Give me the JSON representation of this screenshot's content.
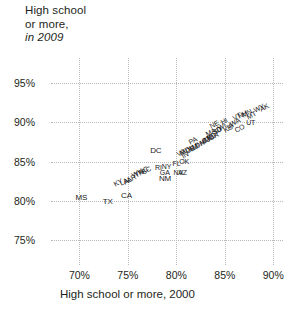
{
  "chart_data": {
    "type": "scatter",
    "ylabel_line1": "High school",
    "ylabel_line2": "or more,",
    "ylabel_line3": "in 2009",
    "xlabel": "High school or more, 2000",
    "xlim": [
      68.0,
      91.0
    ],
    "ylim": [
      73.0,
      97.0
    ],
    "xticks": [
      "70%",
      "75%",
      "80%",
      "85%",
      "90%"
    ],
    "xtick_values": [
      70,
      75,
      80,
      85,
      90
    ],
    "yticks": [
      "75%",
      "80%",
      "85%",
      "90%",
      "95%"
    ],
    "ytick_values": [
      75,
      80,
      85,
      90,
      95
    ],
    "grid": true,
    "legend": "none",
    "point_style": "text-label",
    "xlabel_axis": "High school or more, 2000",
    "ylabel_axis": "High school or more, in 2009",
    "points": [
      {
        "label": "MS",
        "x": 69.6,
        "y": 80.4,
        "rot": 0
      },
      {
        "label": "TX",
        "x": 72.4,
        "y": 79.9,
        "rot": 0
      },
      {
        "label": "CA",
        "x": 74.3,
        "y": 80.6,
        "rot": 0
      },
      {
        "label": "KY",
        "x": 73.6,
        "y": 82.0,
        "rot": -28
      },
      {
        "label": "LA",
        "x": 74.2,
        "y": 82.2,
        "rot": -28
      },
      {
        "label": "AL",
        "x": 74.6,
        "y": 82.3,
        "rot": -28
      },
      {
        "label": "AR",
        "x": 74.9,
        "y": 82.5,
        "rot": -28
      },
      {
        "label": "WV",
        "x": 75.4,
        "y": 83.2,
        "rot": -28
      },
      {
        "label": "TN",
        "x": 75.7,
        "y": 83.1,
        "rot": -28
      },
      {
        "label": "NC",
        "x": 76.1,
        "y": 83.5,
        "rot": -28
      },
      {
        "label": "SC",
        "x": 76.5,
        "y": 83.6,
        "rot": -28
      },
      {
        "label": "NM",
        "x": 78.2,
        "y": 82.8,
        "rot": 0
      },
      {
        "label": "GA",
        "x": 78.3,
        "y": 83.6,
        "rot": 0
      },
      {
        "label": "RI",
        "x": 77.8,
        "y": 84.2,
        "rot": 0
      },
      {
        "label": "NY",
        "x": 78.5,
        "y": 84.3,
        "rot": 0
      },
      {
        "label": "FL",
        "x": 79.6,
        "y": 84.7,
        "rot": 0
      },
      {
        "label": "OK",
        "x": 80.3,
        "y": 84.9,
        "rot": 0
      },
      {
        "label": "AZ",
        "x": 80.2,
        "y": 83.6,
        "rot": 0
      },
      {
        "label": "NV",
        "x": 79.7,
        "y": 83.5,
        "rot": 0
      },
      {
        "label": "DC",
        "x": 77.3,
        "y": 86.3,
        "rot": 0
      },
      {
        "label": "VA",
        "x": 80.1,
        "y": 85.8,
        "rot": -28
      },
      {
        "label": "MD",
        "x": 80.4,
        "y": 86.0,
        "rot": -28
      },
      {
        "label": "IN",
        "x": 80.6,
        "y": 85.6,
        "rot": -28
      },
      {
        "label": "DE",
        "x": 81.0,
        "y": 86.2,
        "rot": -28
      },
      {
        "label": "IL",
        "x": 81.2,
        "y": 86.4,
        "rot": -28
      },
      {
        "label": "NJ",
        "x": 81.4,
        "y": 86.5,
        "rot": -28
      },
      {
        "label": "MI",
        "x": 81.6,
        "y": 86.7,
        "rot": -28
      },
      {
        "label": "OH",
        "x": 81.9,
        "y": 86.9,
        "rot": -28
      },
      {
        "label": "PA",
        "x": 81.3,
        "y": 87.3,
        "rot": -28
      },
      {
        "label": "MO",
        "x": 82.4,
        "y": 87.2,
        "rot": -28
      },
      {
        "label": "CT",
        "x": 82.6,
        "y": 87.5,
        "rot": -28
      },
      {
        "label": "ME",
        "x": 82.9,
        "y": 87.6,
        "rot": -28
      },
      {
        "label": "ND",
        "x": 83.2,
        "y": 87.8,
        "rot": -28
      },
      {
        "label": "OR",
        "x": 83.4,
        "y": 87.9,
        "rot": -28
      },
      {
        "label": "MA",
        "x": 83.1,
        "y": 88.4,
        "rot": -28
      },
      {
        "label": "SD",
        "x": 83.8,
        "y": 88.6,
        "rot": -28
      },
      {
        "label": "ID",
        "x": 84.0,
        "y": 88.7,
        "rot": -28
      },
      {
        "label": "NE",
        "x": 83.5,
        "y": 89.4,
        "rot": -28
      },
      {
        "label": "WI",
        "x": 84.3,
        "y": 89.1,
        "rot": -28
      },
      {
        "label": "KS",
        "x": 84.9,
        "y": 88.9,
        "rot": -28
      },
      {
        "label": "IA",
        "x": 85.2,
        "y": 89.3,
        "rot": -28
      },
      {
        "label": "HI",
        "x": 84.6,
        "y": 89.9,
        "rot": -28
      },
      {
        "label": "WA",
        "x": 85.5,
        "y": 89.6,
        "rot": -28
      },
      {
        "label": "CO",
        "x": 86.1,
        "y": 88.9,
        "rot": -28
      },
      {
        "label": "VT",
        "x": 85.8,
        "y": 90.4,
        "rot": -28
      },
      {
        "label": "NH",
        "x": 86.4,
        "y": 90.7,
        "rot": -28
      },
      {
        "label": "MN",
        "x": 86.8,
        "y": 90.8,
        "rot": -28
      },
      {
        "label": "UT",
        "x": 87.2,
        "y": 89.9,
        "rot": 0
      },
      {
        "label": "MT",
        "x": 87.3,
        "y": 90.5,
        "rot": -28
      },
      {
        "label": "WY",
        "x": 88.0,
        "y": 91.4,
        "rot": -28
      },
      {
        "label": "AK",
        "x": 88.6,
        "y": 91.5,
        "rot": -28
      }
    ]
  }
}
